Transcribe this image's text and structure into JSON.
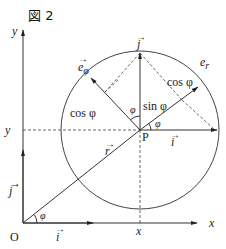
{
  "figure": {
    "title": "図 2",
    "labels": {
      "y_axis": "y",
      "x_axis": "x",
      "origin": "O",
      "y_coord": "y",
      "x_coord": "x",
      "point": "P",
      "r_vec": "r",
      "j_left": "j",
      "i_bottom": "i",
      "j_top": "j",
      "i_right": "i",
      "e_r": "e",
      "e_r_sub": "r",
      "e_phi": "e",
      "e_phi_sub": "φ",
      "cos_left": "cos φ",
      "cos_right": "cos φ",
      "sin": "sin φ",
      "phi_origin": "φ",
      "phi_center_left": "φ",
      "phi_center_right": "φ",
      "phi_p": "φ"
    },
    "colors": {
      "stroke": "#333333",
      "text": "#222222",
      "background": "#ffffff"
    }
  }
}
